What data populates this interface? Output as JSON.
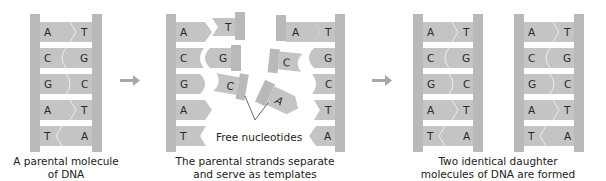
{
  "colors": {
    "backbone": "#b9b9b9",
    "base_fill": "#c4c4c4",
    "rung_bg": "#d2d2d2",
    "arrow": "#a8a8a8",
    "text": "#222222"
  },
  "panels": [
    {
      "id": "parental",
      "caption_line1": "A parental molecule",
      "caption_line2": "of DNA",
      "pairs": [
        [
          "A",
          "T"
        ],
        [
          "C",
          "G"
        ],
        [
          "G",
          "C"
        ],
        [
          "A",
          "T"
        ],
        [
          "T",
          "A"
        ]
      ]
    },
    {
      "id": "separation",
      "caption_line1": "The parental strands separate",
      "caption_line2": "and serve as templates",
      "left_strand": [
        "A",
        "C",
        "G",
        "A",
        "T"
      ],
      "right_strand": [
        "T",
        "G",
        "C",
        "T",
        "A"
      ],
      "free_nucleotides": [
        "T",
        "G",
        "C",
        "A",
        "A",
        "C"
      ],
      "free_label": "Free nucleotides"
    },
    {
      "id": "daughters",
      "caption_line1": "Two identical daughter",
      "caption_line2": "molecules of DNA are formed",
      "molecules": [
        {
          "pairs": [
            [
              "A",
              "T"
            ],
            [
              "C",
              "G"
            ],
            [
              "G",
              "C"
            ],
            [
              "A",
              "T"
            ],
            [
              "T",
              "A"
            ]
          ]
        },
        {
          "pairs": [
            [
              "A",
              "T"
            ],
            [
              "C",
              "G"
            ],
            [
              "G",
              "C"
            ],
            [
              "A",
              "T"
            ],
            [
              "T",
              "A"
            ]
          ]
        }
      ]
    }
  ]
}
